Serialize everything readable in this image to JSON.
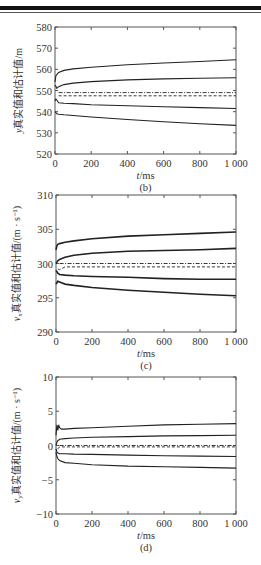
{
  "chart_data": [
    {
      "id": "b",
      "type": "line",
      "caption": "(b)",
      "title": "",
      "xlabel_italic": "t",
      "xlabel_rest": "/ms",
      "ylabel_var": "y",
      "ylabel_sub": "",
      "ylabel_rest": "真实值和估计值/m",
      "xlim": [
        0,
        1000
      ],
      "ylim": [
        520,
        580
      ],
      "xticks": [
        0,
        200,
        400,
        600,
        800,
        1000
      ],
      "xtick_labels": [
        "0",
        "200",
        "400",
        "600",
        "800",
        "1 000"
      ],
      "yticks": [
        520,
        530,
        540,
        550,
        560,
        570,
        580
      ],
      "yticks_labels": [
        "520",
        "530",
        "540",
        "550",
        "560",
        "570",
        "580"
      ],
      "grid": false,
      "legend": "none",
      "series": [
        {
          "name": "upper bound (outer)",
          "style": "solid",
          "x": [
            0,
            5,
            10,
            20,
            50,
            100,
            200,
            400,
            600,
            800,
            1000
          ],
          "values": [
            554,
            557,
            557.5,
            558.5,
            559.5,
            560.2,
            561,
            562.2,
            563,
            563.7,
            564.5
          ]
        },
        {
          "name": "upper bound (inner)",
          "style": "solid",
          "x": [
            0,
            5,
            10,
            20,
            50,
            100,
            200,
            400,
            600,
            800,
            1000
          ],
          "values": [
            552.5,
            552,
            551,
            551.8,
            552.8,
            553.5,
            554.2,
            555,
            555.5,
            555.8,
            556
          ]
        },
        {
          "name": "true value",
          "style": "dashdot",
          "x": [
            20,
            1000
          ],
          "values": [
            549,
            549
          ]
        },
        {
          "name": "estimate",
          "style": "dashed",
          "x": [
            20,
            1000
          ],
          "values": [
            547.5,
            547.5
          ]
        },
        {
          "name": "lower bound (inner)",
          "style": "solid",
          "x": [
            0,
            5,
            10,
            20,
            50,
            100,
            200,
            400,
            600,
            800,
            1000
          ],
          "values": [
            545,
            546,
            545.5,
            544.2,
            544,
            543.8,
            543.3,
            542.8,
            542.3,
            541.9,
            541.5
          ]
        },
        {
          "name": "lower bound (outer)",
          "style": "solid",
          "x": [
            0,
            5,
            10,
            20,
            50,
            100,
            200,
            400,
            600,
            800,
            1000
          ],
          "values": [
            540,
            539.5,
            539,
            538.8,
            538.5,
            538.2,
            537.5,
            536.3,
            535.2,
            534.3,
            533.5
          ]
        }
      ]
    },
    {
      "id": "c",
      "type": "line",
      "caption": "(c)",
      "title": "",
      "xlabel_italic": "t",
      "xlabel_rest": "/ms",
      "ylabel_var": "v",
      "ylabel_sub": "x",
      "ylabel_rest": "真实值和估计值/(m · s⁻¹)",
      "xlim": [
        0,
        1000
      ],
      "ylim": [
        290,
        310
      ],
      "xticks": [
        0,
        200,
        400,
        600,
        800,
        1000
      ],
      "xtick_labels": [
        "0",
        "200",
        "400",
        "600",
        "800",
        "1 000"
      ],
      "yticks": [
        290,
        295,
        300,
        305,
        310
      ],
      "yticks_labels": [
        "290",
        "295",
        "300",
        "305",
        "310"
      ],
      "grid": false,
      "legend": "none",
      "series": [
        {
          "name": "upper bound (outer)",
          "style": "solid",
          "x": [
            0,
            5,
            10,
            20,
            50,
            100,
            200,
            400,
            600,
            800,
            1000
          ],
          "values": [
            302,
            302.6,
            302.8,
            302.9,
            303.1,
            303.3,
            303.6,
            304,
            304.2,
            304.4,
            304.6
          ]
        },
        {
          "name": "upper bound (inner)",
          "style": "solid",
          "x": [
            0,
            5,
            10,
            20,
            50,
            100,
            200,
            400,
            600,
            800,
            1000
          ],
          "values": [
            300,
            300.2,
            300.4,
            300.6,
            300.9,
            301.2,
            301.5,
            301.8,
            301.9,
            302,
            302.2
          ]
        },
        {
          "name": "true value",
          "style": "dashdot",
          "x": [
            20,
            1000
          ],
          "values": [
            300,
            300
          ]
        },
        {
          "name": "estimate",
          "style": "dashed",
          "x": [
            10,
            20,
            50,
            1000
          ],
          "values": [
            299.2,
            299.1,
            299.5,
            299.5
          ]
        },
        {
          "name": "lower bound (inner)",
          "style": "solid",
          "x": [
            0,
            5,
            10,
            20,
            50,
            100,
            200,
            400,
            600,
            800,
            1000
          ],
          "values": [
            299,
            298.8,
            298.6,
            298.4,
            298.3,
            298.2,
            298.1,
            298,
            297.8,
            297.7,
            297.7
          ]
        },
        {
          "name": "lower bound (outer)",
          "style": "solid",
          "x": [
            0,
            5,
            10,
            20,
            50,
            100,
            200,
            400,
            600,
            800,
            1000
          ],
          "values": [
            297,
            297.2,
            297.4,
            297.3,
            297,
            296.8,
            296.5,
            296.1,
            295.8,
            295.5,
            295.3
          ]
        }
      ]
    },
    {
      "id": "d",
      "type": "line",
      "caption": "(d)",
      "title": "",
      "xlabel_italic": "t",
      "xlabel_rest": "/ms",
      "ylabel_var": "v",
      "ylabel_sub": "y",
      "ylabel_rest": "真实值和估计值/(m · s⁻¹)",
      "xlim": [
        0,
        1000
      ],
      "ylim": [
        -10,
        10
      ],
      "xticks": [
        0,
        200,
        400,
        600,
        800,
        1000
      ],
      "xtick_labels": [
        "0",
        "200",
        "400",
        "600",
        "800",
        "1 000"
      ],
      "yticks": [
        -10,
        -5,
        0,
        5,
        10
      ],
      "yticks_labels": [
        "−10",
        "−5",
        "0",
        "5",
        "10"
      ],
      "grid": false,
      "legend": "none",
      "series": [
        {
          "name": "upper bound (outer)",
          "style": "solid",
          "x": [
            0,
            5,
            10,
            15,
            20,
            30,
            50,
            100,
            200,
            400,
            600,
            800,
            1000
          ],
          "values": [
            1.5,
            3,
            2.2,
            3,
            2.6,
            2.4,
            2.4,
            2.5,
            2.6,
            2.8,
            3,
            3.1,
            3.2
          ]
        },
        {
          "name": "upper bound (inner)",
          "style": "solid",
          "x": [
            0,
            5,
            10,
            20,
            50,
            100,
            200,
            400,
            600,
            800,
            1000
          ],
          "values": [
            0,
            0.5,
            0.7,
            0.9,
            1,
            1.1,
            1.2,
            1.3,
            1.4,
            1.45,
            1.5
          ]
        },
        {
          "name": "true value",
          "style": "dashdot",
          "x": [
            20,
            1000
          ],
          "values": [
            0,
            0
          ]
        },
        {
          "name": "estimate",
          "style": "dashed",
          "x": [
            10,
            20,
            1000
          ],
          "values": [
            -0.5,
            -0.2,
            -0.2
          ]
        },
        {
          "name": "lower bound (inner)",
          "style": "solid",
          "x": [
            0,
            5,
            10,
            20,
            50,
            100,
            200,
            400,
            600,
            800,
            1000
          ],
          "values": [
            -0.5,
            -0.9,
            -1.1,
            -1.2,
            -1.2,
            -1.25,
            -1.3,
            -1.4,
            -1.5,
            -1.55,
            -1.6
          ]
        },
        {
          "name": "lower bound (outer)",
          "style": "solid",
          "x": [
            0,
            5,
            10,
            20,
            50,
            100,
            200,
            400,
            600,
            800,
            1000
          ],
          "values": [
            -1,
            -1.6,
            -1.9,
            -2.2,
            -2.5,
            -2.6,
            -2.8,
            -3,
            -3.1,
            -3.2,
            -3.3
          ]
        }
      ]
    }
  ]
}
